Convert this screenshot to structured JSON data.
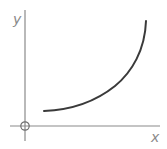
{
  "diagram": {
    "type": "function-sketch",
    "axes": {
      "x_label": "x",
      "y_label": "y",
      "origin_marker": "circle"
    },
    "colors": {
      "axis": "#8a8a8a",
      "curve": "#3a3a3a",
      "background": "#ffffff"
    },
    "curve": {
      "shape": "increasing-convex",
      "points_px": [
        [
          44,
          111
        ],
        [
          60,
          110
        ],
        [
          80,
          106
        ],
        [
          100,
          97
        ],
        [
          115,
          86
        ],
        [
          128,
          73
        ],
        [
          138,
          55
        ],
        [
          144,
          35
        ],
        [
          146,
          21
        ]
      ]
    }
  }
}
